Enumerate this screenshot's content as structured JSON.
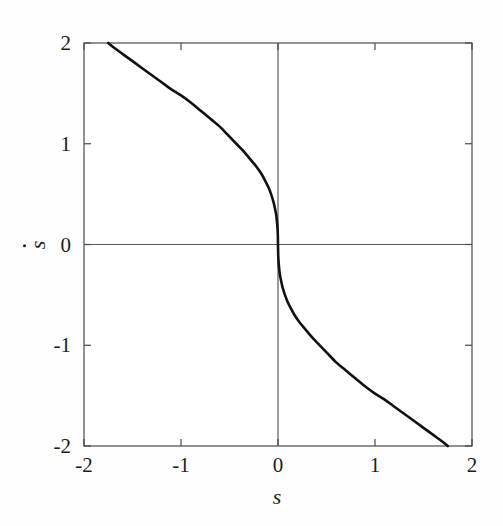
{
  "figure": {
    "kind": "phase-portrait",
    "background": "#fefefe",
    "frame_color": "#4a4a4a",
    "curve_color": "#111111"
  },
  "axes": {
    "x_title": "s",
    "y_title": "s",
    "y_title_has_dot": true,
    "x_ticks": [
      "-2",
      "-1",
      "0",
      "1",
      "2"
    ],
    "y_ticks": [
      "2",
      "1",
      "0",
      "-1",
      "-2"
    ]
  },
  "chart_data": {
    "type": "line",
    "title": "",
    "subtitle": "",
    "xlabel": "s",
    "ylabel": "ṡ",
    "xlim": [
      -2,
      2
    ],
    "ylim": [
      -2,
      2
    ],
    "xticks": [
      -2,
      -1,
      0,
      1,
      2
    ],
    "yticks": [
      -2,
      -1,
      0,
      1,
      2
    ],
    "xticklabels": [
      "-2",
      "-1",
      "0",
      "1",
      "2"
    ],
    "yticklabels": [
      "-2",
      "-1",
      "0",
      "1",
      "2"
    ],
    "grid": false,
    "legend": null,
    "legend_position": "none",
    "axis_crosshair_lines": [
      {
        "orientation": "vertical",
        "value": 0
      },
      {
        "orientation": "horizontal",
        "value": 0
      }
    ],
    "series": [
      {
        "name": "sliding surface",
        "style": "solid",
        "color": "#111111",
        "linewidth": 2.6,
        "x": [
          -1.75,
          -1.7,
          -1.6,
          -1.5,
          -1.4,
          -1.3,
          -1.2,
          -1.1,
          -1.0,
          -0.9,
          -0.8,
          -0.7,
          -0.6,
          -0.5,
          -0.42,
          -0.35,
          -0.28,
          -0.22,
          -0.17,
          -0.13,
          -0.095,
          -0.068,
          -0.046,
          -0.03,
          -0.018,
          -0.01,
          -0.005,
          -0.002,
          0.0,
          0.002,
          0.005,
          0.01,
          0.018,
          0.03,
          0.046,
          0.068,
          0.095,
          0.13,
          0.17,
          0.22,
          0.28,
          0.35,
          0.42,
          0.5,
          0.6,
          0.7,
          0.8,
          0.9,
          1.0,
          1.1,
          1.2,
          1.3,
          1.4,
          1.5,
          1.6,
          1.7,
          1.75
        ],
        "y": [
          2.0,
          1.96,
          1.89,
          1.82,
          1.75,
          1.68,
          1.61,
          1.54,
          1.48,
          1.41,
          1.33,
          1.25,
          1.17,
          1.07,
          0.99,
          0.92,
          0.84,
          0.77,
          0.7,
          0.63,
          0.56,
          0.49,
          0.42,
          0.35,
          0.29,
          0.22,
          0.16,
          0.1,
          0.0,
          -0.1,
          -0.16,
          -0.22,
          -0.29,
          -0.35,
          -0.42,
          -0.49,
          -0.56,
          -0.63,
          -0.7,
          -0.77,
          -0.84,
          -0.92,
          -0.99,
          -1.07,
          -1.17,
          -1.25,
          -1.33,
          -1.41,
          -1.48,
          -1.54,
          -1.61,
          -1.68,
          -1.75,
          -1.82,
          -1.89,
          -1.96,
          -2.0
        ]
      }
    ],
    "annotations": []
  },
  "geometry": {
    "plot_left": 84,
    "plot_top": 43,
    "plot_right": 472,
    "plot_bottom": 446,
    "tick_len": 7
  }
}
